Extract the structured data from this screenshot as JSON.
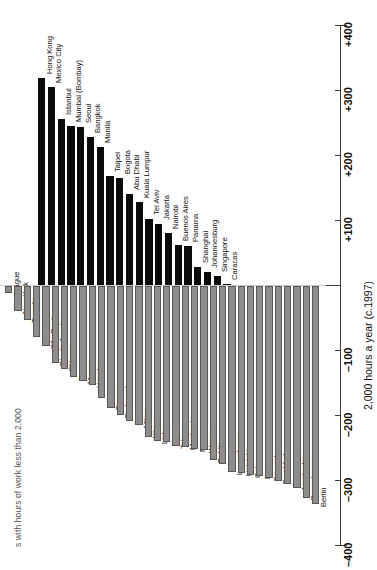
{
  "chart_data": {
    "type": "bar",
    "orientation": "rotated-vertical",
    "title": "s with hours of work less than 2,000",
    "subtitle": "",
    "xlabel": "",
    "ylabel": "2,000 hours a year (c.1997)",
    "ylim": [
      -400,
      400
    ],
    "grid": false,
    "legend": null,
    "tick_labels": [
      "+400",
      "+300",
      "+200",
      "+100",
      "–100",
      "–200",
      "–300",
      "–400"
    ],
    "tick_values": [
      400,
      300,
      200,
      100,
      -100,
      -200,
      -300,
      -400
    ],
    "zero_label": "0",
    "colors": {
      "positive": "#0b0b0b",
      "negative": "#8d8d8d",
      "negative_border": "#565656",
      "axis": "#3a3a3a"
    },
    "categories": [
      "Hong Kong",
      "Mexico City",
      "Istanbul",
      "Mumbai (Bombay)",
      "Seoul",
      "Bangkok",
      "Manila",
      "Taipei",
      "Bogota",
      "Abu Dhabi",
      "Kuala Lumpur",
      "Tel Aviv",
      "Jakarta",
      "Nairobi",
      "Buenos Aires",
      "Panama",
      "Shanghai",
      "Johannesburg",
      "Singapore",
      "Caracas",
      "Prague",
      "New York",
      "Toronto",
      "Los Angeles",
      "São Paulo",
      "Rio de Janeiro",
      "Chicago",
      "Zürich",
      "Moscow",
      "Houston",
      "London",
      "Geneva",
      "Budapest",
      "Stockholm",
      "Milan",
      "Athens",
      "Lisbon",
      "Nicosia",
      "Tokyo",
      "Montreal",
      "Madrid",
      "Warsaw",
      "Dublin",
      "Sydney",
      "Luxembourg",
      "Helsinki",
      "Oslo",
      "Paris",
      "Brussels",
      "Frankfurt",
      "Vienna",
      "Amsterdam",
      "Copenhagen",
      "Berlin"
    ],
    "values": [
      318,
      305,
      255,
      245,
      243,
      228,
      212,
      168,
      165,
      140,
      128,
      102,
      94,
      80,
      62,
      60,
      28,
      20,
      14,
      2,
      -10,
      -38,
      -52,
      -78,
      -92,
      -118,
      -128,
      -140,
      -146,
      -152,
      -172,
      -188,
      -198,
      -208,
      -214,
      -232,
      -238,
      -240,
      -246,
      -248,
      -250,
      -252,
      -268,
      -274,
      -286,
      -288,
      -290,
      -292,
      -296,
      -300,
      -304,
      -310,
      -326,
      -336
    ]
  }
}
